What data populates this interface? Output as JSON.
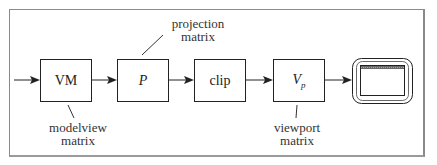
{
  "diagram": {
    "blocks": [
      {
        "id": "vm",
        "label": "VM",
        "italic": false
      },
      {
        "id": "p",
        "label": "P",
        "italic": true
      },
      {
        "id": "clip",
        "label": "clip",
        "italic": false
      },
      {
        "id": "vp",
        "label": "V",
        "subscript": "p",
        "italic": true
      }
    ],
    "annotations": {
      "modelview": {
        "line1": "modelview",
        "line2": "matrix"
      },
      "projection": {
        "line1": "projection",
        "line2": "matrix"
      },
      "viewport": {
        "line1": "viewport",
        "line2": "matrix"
      }
    },
    "output": {
      "icon": "monitor-icon"
    },
    "colors": {
      "stroke": "#222222",
      "frame": "#8a8a8a",
      "background": "#ffffff"
    }
  }
}
